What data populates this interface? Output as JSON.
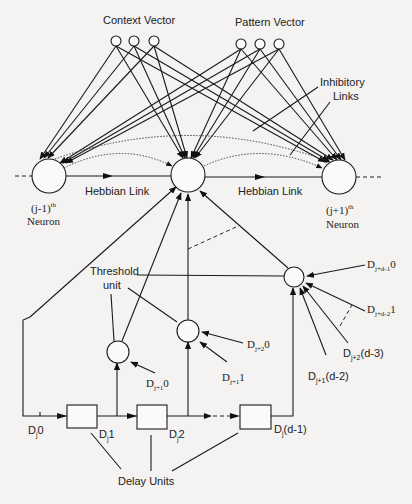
{
  "diagram": {
    "labels": {
      "context_vector": "Context Vector",
      "pattern_vector": "Pattern Vector",
      "inhibitory_links_1": "Inhibitory",
      "inhibitory_links_2": "Links",
      "hebbian_link_left": "Hebbian Link",
      "hebbian_link_right": "Hebbian Link",
      "threshold_unit_1": "Threshold",
      "threshold_unit_2": "unit",
      "delay_units": "Delay Units"
    },
    "neurons": {
      "left": {
        "prefix": "(j-1)",
        "sup": "th",
        "name": "Neuron"
      },
      "right": {
        "prefix": "(j+1)",
        "sup": "th",
        "name": "Neuron"
      }
    },
    "inputs": {
      "d_j_plus_1_0": {
        "base": "D",
        "sub": "j+1",
        "tail": "0"
      },
      "d_j_plus_2_0": {
        "base": "D",
        "sub": "j+2",
        "tail": "0"
      },
      "d_j_plus_1_1": {
        "base": "D",
        "sub": "j+1",
        "tail": "1"
      },
      "d_j_plus_d_minus_1_0": {
        "base": "D",
        "sub": "j+d-1",
        "tail": "0"
      },
      "d_j_plus_d_minus_2_1": {
        "base": "D",
        "sub": "j+d-2",
        "tail": "1"
      },
      "d_j_plus_2_d_minus_3": {
        "base": "D",
        "sub": "j+2",
        "tail": "(d-3)"
      },
      "d_j_plus_1_d_minus_2": {
        "base": "D",
        "sub": "j+1",
        "tail": "(d-2)"
      }
    },
    "delay_chain": {
      "dj0": {
        "base": "D",
        "sub": "j",
        "tail": "0"
      },
      "dj1": {
        "base": "D",
        "sub": "j",
        "tail": "1"
      },
      "dj2": {
        "base": "D",
        "sub": "j",
        "tail": "2"
      },
      "dj_d_minus_1": {
        "base": "D",
        "sub": "j",
        "tail": "(d-1)"
      }
    },
    "colors": {
      "background": "#f4f3f1",
      "stroke": "#1a1a1a"
    }
  }
}
